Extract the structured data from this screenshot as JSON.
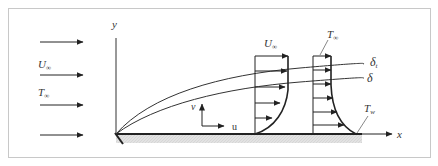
{
  "diagram": {
    "colors": {
      "frame": "#c8c8c8",
      "line": "#222222",
      "plate_fill": "#e0e0e0",
      "text": "#333333"
    },
    "axes": {
      "y_label": "y",
      "x_label": "x"
    },
    "freestream": {
      "velocity_label": "U",
      "velocity_sub": "∞",
      "temperature_label": "T",
      "temperature_sub": "∞",
      "arrow_count": 4
    },
    "velocity_profile": {
      "label": "U",
      "label_sub": "∞",
      "arrow_count": 5
    },
    "temperature_profile": {
      "label": "T",
      "label_sub": "∞",
      "arrow_count": 6
    },
    "boundary_layers": {
      "thermal_label": "δ",
      "thermal_sub": "t",
      "velocity_label": "δ"
    },
    "wall_temperature": {
      "label": "T",
      "label_sub": "w"
    },
    "local_velocity": {
      "v_label": "v",
      "u_label": "u"
    }
  }
}
